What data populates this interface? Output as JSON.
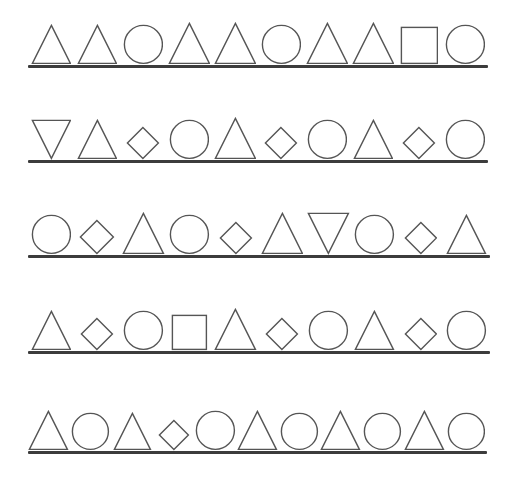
{
  "canvas": {
    "width": 508,
    "height": 478,
    "background": "#ffffff",
    "stroke_color": "#555555",
    "baseline_color": "#3c3c3c"
  },
  "rows": [
    {
      "name": "shape-row-1",
      "top": 22,
      "baseline_y": 65,
      "baseline_width": 460,
      "shapes": [
        {
          "type": "triangle-up",
          "size": 38
        },
        {
          "type": "triangle-up",
          "size": 38
        },
        {
          "type": "circle",
          "size": 38
        },
        {
          "type": "triangle-up",
          "size": 40
        },
        {
          "type": "triangle-up",
          "size": 40
        },
        {
          "type": "circle",
          "size": 38
        },
        {
          "type": "triangle-up",
          "size": 40
        },
        {
          "type": "triangle-up",
          "size": 40
        },
        {
          "type": "square",
          "size": 36
        },
        {
          "type": "circle",
          "size": 38
        }
      ]
    },
    {
      "name": "shape-row-2",
      "top": 118,
      "baseline_y": 160,
      "baseline_width": 460,
      "shapes": [
        {
          "type": "triangle-down",
          "size": 38
        },
        {
          "type": "triangle-up",
          "size": 38
        },
        {
          "type": "diamond",
          "size": 31
        },
        {
          "type": "circle",
          "size": 38
        },
        {
          "type": "triangle-up",
          "size": 40
        },
        {
          "type": "diamond",
          "size": 31
        },
        {
          "type": "circle",
          "size": 38
        },
        {
          "type": "triangle-up",
          "size": 38
        },
        {
          "type": "diamond",
          "size": 31
        },
        {
          "type": "circle",
          "size": 38
        }
      ]
    },
    {
      "name": "shape-row-3",
      "top": 213,
      "baseline_y": 255,
      "baseline_width": 462,
      "shapes": [
        {
          "type": "circle",
          "size": 38
        },
        {
          "type": "diamond",
          "size": 33
        },
        {
          "type": "triangle-up",
          "size": 40
        },
        {
          "type": "circle",
          "size": 38
        },
        {
          "type": "diamond",
          "size": 31
        },
        {
          "type": "triangle-up",
          "size": 40
        },
        {
          "type": "triangle-down",
          "size": 40
        },
        {
          "type": "circle",
          "size": 38
        },
        {
          "type": "diamond",
          "size": 31
        },
        {
          "type": "triangle-up",
          "size": 38
        }
      ]
    },
    {
      "name": "shape-row-4",
      "top": 309,
      "baseline_y": 351,
      "baseline_width": 462,
      "shapes": [
        {
          "type": "triangle-up",
          "size": 38
        },
        {
          "type": "diamond",
          "size": 31
        },
        {
          "type": "circle",
          "size": 38
        },
        {
          "type": "square",
          "size": 34
        },
        {
          "type": "triangle-up",
          "size": 40
        },
        {
          "type": "diamond",
          "size": 31
        },
        {
          "type": "circle",
          "size": 38
        },
        {
          "type": "triangle-up",
          "size": 38
        },
        {
          "type": "diamond",
          "size": 31
        },
        {
          "type": "circle",
          "size": 38
        }
      ]
    },
    {
      "name": "shape-row-5",
      "top": 409,
      "baseline_y": 451,
      "baseline_width": 459,
      "shapes": [
        {
          "type": "triangle-up",
          "size": 38
        },
        {
          "type": "circle",
          "size": 36
        },
        {
          "type": "triangle-up",
          "size": 36
        },
        {
          "type": "diamond",
          "size": 29
        },
        {
          "type": "circle",
          "size": 38
        },
        {
          "type": "triangle-up",
          "size": 38
        },
        {
          "type": "circle",
          "size": 36
        },
        {
          "type": "triangle-up",
          "size": 38
        },
        {
          "type": "circle",
          "size": 36
        },
        {
          "type": "triangle-up",
          "size": 38
        },
        {
          "type": "circle",
          "size": 36
        }
      ]
    }
  ]
}
